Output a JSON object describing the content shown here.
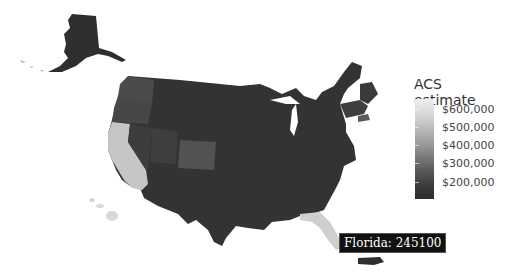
{
  "legend": {
    "title": "ACS estimate",
    "ticks": [
      {
        "label": "$600,000",
        "y": 103
      },
      {
        "label": "$500,000",
        "y": 121
      },
      {
        "label": "$400,000",
        "y": 139
      },
      {
        "label": "$300,000",
        "y": 157
      },
      {
        "label": "$200,000",
        "y": 176
      }
    ]
  },
  "tooltip": {
    "text": "Florida: 245100"
  },
  "colors": {
    "low": "#2e2e2e",
    "mid_dark": "#3c3c3c",
    "mid": "#4f4f4f",
    "light": "#c8c8c8",
    "hover": "#d0d0d0"
  },
  "states": [
    {
      "name": "Alaska",
      "shade": "low"
    },
    {
      "name": "Washington",
      "shade": "mid"
    },
    {
      "name": "Oregon",
      "shade": "mid"
    },
    {
      "name": "California",
      "shade": "light"
    },
    {
      "name": "Nevada",
      "shade": "mid_dark"
    },
    {
      "name": "Utah",
      "shade": "mid_dark"
    },
    {
      "name": "Colorado",
      "shade": "mid"
    },
    {
      "name": "Hawaii",
      "shade": "light"
    },
    {
      "name": "Florida",
      "shade": "hover"
    },
    {
      "name": "Massachusetts",
      "shade": "mid"
    },
    {
      "name": "Puerto Rico",
      "shade": "low"
    }
  ]
}
